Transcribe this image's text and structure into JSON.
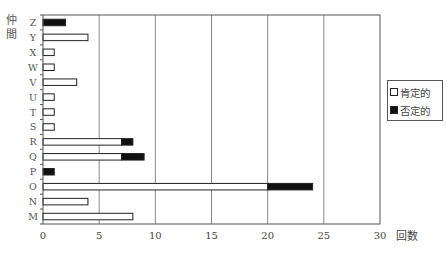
{
  "chart_data": {
    "type": "bar",
    "orientation": "horizontal",
    "stacked": true,
    "title": "",
    "xlabel": "回数",
    "ylabel": "仲間",
    "xlim": [
      0,
      30
    ],
    "xticks": [
      0,
      5,
      10,
      15,
      20,
      25,
      30
    ],
    "grid": {
      "vertical": true,
      "horizontal": false
    },
    "legend_position": "right",
    "categories": [
      "Z",
      "Y",
      "X",
      "W",
      "V",
      "U",
      "T",
      "S",
      "R",
      "Q",
      "P",
      "O",
      "N",
      "M"
    ],
    "series": [
      {
        "name": "肯定的",
        "color": "#ffffff",
        "values": [
          0,
          4,
          1,
          1,
          3,
          1,
          1,
          1,
          7,
          7,
          0,
          20,
          4,
          8
        ]
      },
      {
        "name": "否定的",
        "color": "#111111",
        "values": [
          2,
          0,
          0,
          0,
          0,
          0,
          0,
          0,
          1,
          2,
          1,
          4,
          0,
          0
        ]
      }
    ]
  },
  "legend": {
    "items": [
      {
        "label": "肯定的"
      },
      {
        "label": "否定的"
      }
    ]
  },
  "axes": {
    "x_title": "回数",
    "y_title": "仲間"
  }
}
